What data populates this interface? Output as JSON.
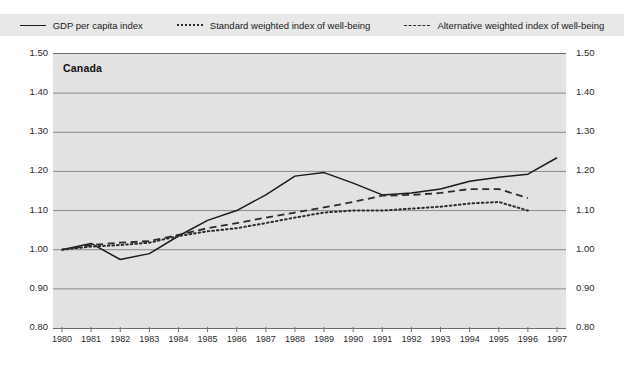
{
  "legend": {
    "items": [
      {
        "label": "GDP per capita index",
        "style": "solid",
        "icon": "line-solid-icon"
      },
      {
        "label": "Standard weighted index of well-being",
        "style": "dotted",
        "icon": "line-dotted-icon"
      },
      {
        "label": "Alternative weighted index of well-being",
        "style": "dashed",
        "icon": "line-dashed-icon"
      }
    ]
  },
  "chart_data": {
    "type": "line",
    "title": "Canada",
    "xlabel": "",
    "ylabel": "",
    "xlim": [
      1980,
      1997
    ],
    "ylim": [
      0.8,
      1.5
    ],
    "grid": true,
    "legend_position": "top",
    "yticks": [
      "0.80",
      "0.90",
      "1.00",
      "1.10",
      "1.20",
      "1.30",
      "1.40",
      "1.50"
    ],
    "categories": [
      1980,
      1981,
      1982,
      1983,
      1984,
      1985,
      1986,
      1987,
      1988,
      1989,
      1990,
      1991,
      1992,
      1993,
      1994,
      1995,
      1996,
      1997
    ],
    "xticks": [
      "1980",
      "1981",
      "1982",
      "1983",
      "1984",
      "1985",
      "1986",
      "1987",
      "1988",
      "1989",
      "1990",
      "1991",
      "1992",
      "1993",
      "1994",
      "1995",
      "1996",
      "1997"
    ],
    "series": [
      {
        "name": "GDP per capita index",
        "style": "solid",
        "x": [
          1980,
          1981,
          1982,
          1983,
          1984,
          1985,
          1986,
          1987,
          1988,
          1989,
          1990,
          1991,
          1992,
          1993,
          1994,
          1995,
          1996,
          1997
        ],
        "values": [
          1.0,
          1.016,
          0.975,
          0.99,
          1.035,
          1.075,
          1.1,
          1.14,
          1.188,
          1.197,
          1.17,
          1.14,
          1.145,
          1.155,
          1.175,
          1.185,
          1.193,
          1.235
        ]
      },
      {
        "name": "Standard weighted index of well-being",
        "style": "dotted",
        "x": [
          1980,
          1981,
          1982,
          1983,
          1984,
          1985,
          1986,
          1987,
          1988,
          1989,
          1990,
          1991,
          1992,
          1993,
          1994,
          1995,
          1996
        ],
        "values": [
          1.0,
          1.008,
          1.012,
          1.018,
          1.035,
          1.047,
          1.055,
          1.068,
          1.082,
          1.095,
          1.1,
          1.1,
          1.105,
          1.11,
          1.118,
          1.122,
          1.1
        ]
      },
      {
        "name": "Alternative weighted index of well-being",
        "style": "dashed",
        "x": [
          1980,
          1981,
          1982,
          1983,
          1984,
          1985,
          1986,
          1987,
          1988,
          1989,
          1990,
          1991,
          1992,
          1993,
          1994,
          1995,
          1996
        ],
        "values": [
          1.0,
          1.012,
          1.018,
          1.022,
          1.038,
          1.055,
          1.068,
          1.082,
          1.095,
          1.108,
          1.122,
          1.138,
          1.14,
          1.145,
          1.155,
          1.155,
          1.132
        ]
      }
    ],
    "colors": {
      "gdp_line": "#1a1a1a",
      "standard_line": "#2b2b2b",
      "alternative_line": "#2b2b2b",
      "plot_background": "#e2e2e2",
      "gridline": "#8a8a8a",
      "legend_background": "#e8e8e8"
    }
  }
}
